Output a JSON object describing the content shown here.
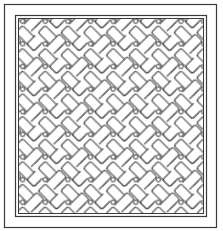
{
  "artwork": {
    "kind": "coloring-page",
    "pattern": "diagonal-basket-weave",
    "colors": {
      "background": "#ffffff",
      "line": "#3a3a3a",
      "fill": "#ffffff"
    },
    "frame": {
      "outer": {
        "x": 4,
        "y": 4,
        "width": 213,
        "height": 224
      },
      "inner_outer_line": {
        "x": 15,
        "y": 15,
        "width": 192,
        "height": 202
      },
      "inner_inner_line": {
        "x": 18,
        "y": 18,
        "width": 186,
        "height": 196
      }
    },
    "tile": {
      "size": 32,
      "rotation_deg": 45,
      "bar_length": 26,
      "bar_width": 10,
      "square_size": 8
    }
  }
}
